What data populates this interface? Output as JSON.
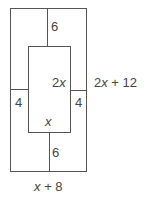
{
  "diagram": {
    "labels": {
      "top_gap": "6",
      "bottom_gap": "6",
      "left_gap": "4",
      "right_gap": "4",
      "inner_height_var": "2x",
      "inner_width_var": "x",
      "outer_height": "2x + 12",
      "outer_width": "x + 8"
    },
    "colors": {
      "stroke": "#555555",
      "text": "#444444",
      "background": "#ffffff"
    }
  }
}
